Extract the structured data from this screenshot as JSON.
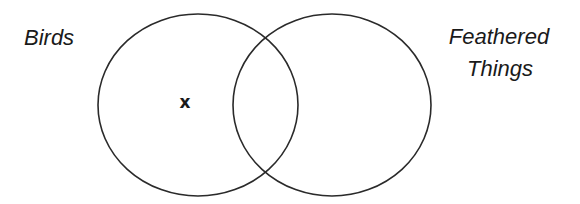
{
  "diagram": {
    "type": "venn",
    "sets": [
      {
        "label": "Birds",
        "circle": {
          "cx": 198,
          "cy": 105,
          "rx": 100,
          "ry": 91
        }
      },
      {
        "label": "Feathered Things",
        "label_lines": [
          "Feathered",
          "Things"
        ],
        "circle": {
          "cx": 332,
          "cy": 105,
          "rx": 99,
          "ry": 91
        }
      }
    ],
    "marker": {
      "symbol": "x",
      "x": 185,
      "y": 103,
      "region": "Birds only"
    },
    "colors": {
      "stroke": "#2a2a2a",
      "text": "#1a1a1a",
      "background": "#ffffff"
    }
  }
}
